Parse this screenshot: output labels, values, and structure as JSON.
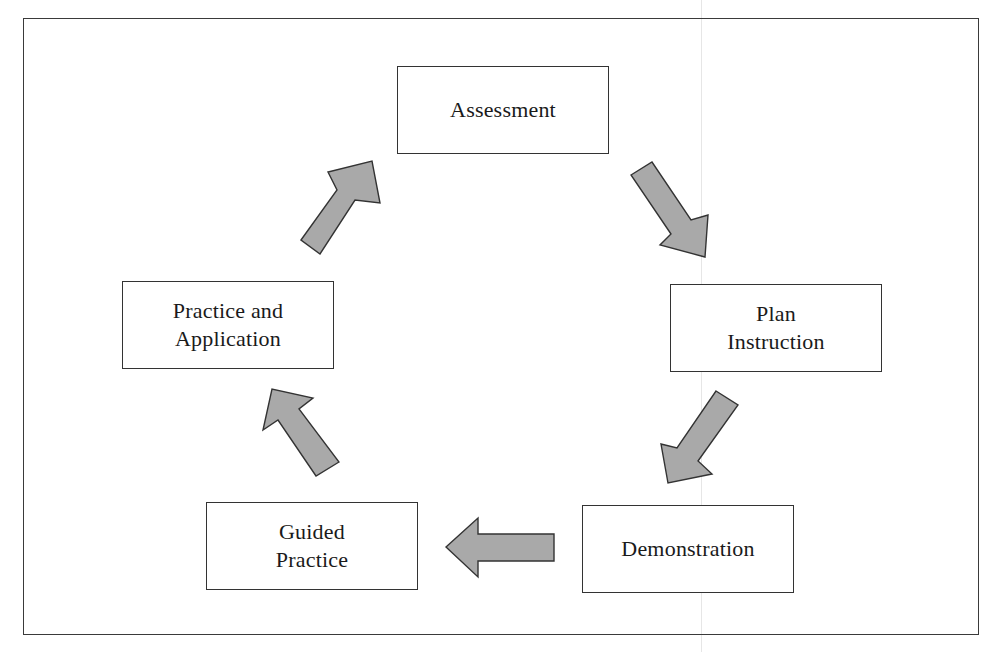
{
  "diagram": {
    "type": "cycle",
    "nodes": [
      {
        "id": "assessment",
        "lines": [
          "Assessment"
        ]
      },
      {
        "id": "plan-instruction",
        "lines": [
          "Plan",
          "Instruction"
        ]
      },
      {
        "id": "demonstration",
        "lines": [
          "Demonstration"
        ]
      },
      {
        "id": "guided-practice",
        "lines": [
          "Guided",
          "Practice"
        ]
      },
      {
        "id": "practice-and-application",
        "lines": [
          "Practice and",
          "Application"
        ]
      }
    ],
    "edges": [
      {
        "from": "assessment",
        "to": "plan-instruction",
        "direction": "down-right"
      },
      {
        "from": "plan-instruction",
        "to": "demonstration",
        "direction": "down-left"
      },
      {
        "from": "demonstration",
        "to": "guided-practice",
        "direction": "left"
      },
      {
        "from": "guided-practice",
        "to": "practice-and-application",
        "direction": "up-left"
      },
      {
        "from": "practice-and-application",
        "to": "assessment",
        "direction": "up-right"
      }
    ],
    "colors": {
      "arrow_fill": "#a9a9a9",
      "arrow_stroke": "#333333",
      "box_border": "#333333",
      "frame_border": "#3a3a3a",
      "background": "#ffffff"
    }
  }
}
